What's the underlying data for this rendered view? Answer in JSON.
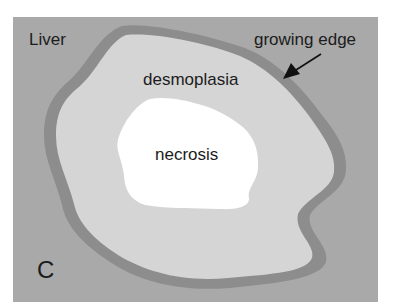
{
  "panel": {
    "letter": "C",
    "colors": {
      "page": "#ffffff",
      "liver": "#a9a9a9",
      "growing_edge": "#8d8d8d",
      "desmoplasia": "#d5d5d5",
      "necrosis": "#ffffff",
      "text": "#1c1c1c"
    }
  },
  "labels": {
    "liver": "Liver",
    "growing_edge": "growing edge",
    "desmoplasia": "desmoplasia",
    "necrosis": "necrosis",
    "panel_letter": "C"
  }
}
